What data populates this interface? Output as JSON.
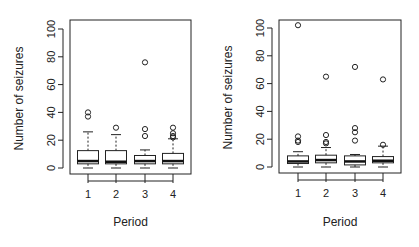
{
  "chart_data": [
    {
      "type": "box",
      "title": "",
      "xlabel": "Period",
      "ylabel": "Number of seizures",
      "ylim": [
        0,
        100
      ],
      "yticks": [
        0,
        20,
        40,
        60,
        80,
        100
      ],
      "categories": [
        "1",
        "2",
        "3",
        "4"
      ],
      "boxes": [
        {
          "category": "1",
          "whisker_low": 0,
          "q1": 3,
          "median": 5,
          "q3": 12.5,
          "whisker_high": 26,
          "outliers": [
            37,
            40
          ]
        },
        {
          "category": "2",
          "whisker_low": 0,
          "q1": 3,
          "median": 4.5,
          "q3": 12.5,
          "whisker_high": 24,
          "outliers": [
            29
          ]
        },
        {
          "category": "3",
          "whisker_low": 0,
          "q1": 3,
          "median": 5,
          "q3": 9,
          "whisker_high": 13,
          "outliers": [
            23,
            28,
            76
          ]
        },
        {
          "category": "4",
          "whisker_low": 0,
          "q1": 3,
          "median": 5,
          "q3": 10.5,
          "whisker_high": 21,
          "outliers": [
            22,
            23,
            25,
            29
          ]
        }
      ]
    },
    {
      "type": "box",
      "title": "",
      "xlabel": "Period",
      "ylabel": "Number of seizures",
      "ylim": [
        0,
        100
      ],
      "yticks": [
        0,
        20,
        40,
        60,
        80,
        100
      ],
      "categories": [
        "1",
        "2",
        "3",
        "4"
      ],
      "boxes": [
        {
          "category": "1",
          "whisker_low": 0,
          "q1": 2.5,
          "median": 4,
          "q3": 8,
          "whisker_high": 11,
          "outliers": [
            18,
            19,
            22,
            102
          ]
        },
        {
          "category": "2",
          "whisker_low": 0,
          "q1": 3,
          "median": 5,
          "q3": 8.5,
          "whisker_high": 14,
          "outliers": [
            17,
            18,
            23,
            65
          ]
        },
        {
          "category": "3",
          "whisker_low": 0,
          "q1": 1.5,
          "median": 4,
          "q3": 8,
          "whisker_high": 9,
          "outliers": [
            19,
            25,
            28,
            72
          ]
        },
        {
          "category": "4",
          "whisker_low": 0,
          "q1": 3,
          "median": 4.5,
          "q3": 7.5,
          "whisker_high": 15,
          "outliers": [
            16,
            63
          ]
        }
      ]
    }
  ],
  "panels": [
    {
      "xlabel": "Period",
      "ylabel": "Number of seizures"
    },
    {
      "xlabel": "Period",
      "ylabel": "Number of seizures"
    }
  ]
}
